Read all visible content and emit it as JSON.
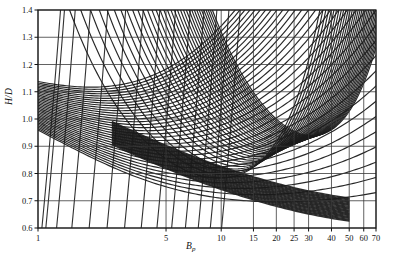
{
  "figure": {
    "background": "#ffffff",
    "line_color": "#1b1b1b",
    "grid_color": "#3a3a3a",
    "label_color": "#111111"
  },
  "axes": {
    "x_title_main": "B",
    "x_title_sub": "p",
    "y_title": "H/D"
  },
  "chart_data": {
    "type": "line",
    "title": "",
    "subtitle": "",
    "xlabel": "B_p",
    "ylabel": "H/D",
    "xscale": "log",
    "yscale": "linear",
    "xlim": [
      1,
      70
    ],
    "ylim": [
      0.6,
      1.4
    ],
    "grid": true,
    "legend": "none",
    "x_ticks": [
      1,
      5,
      10,
      15,
      20,
      25,
      30,
      40,
      50,
      60,
      70
    ],
    "x_tick_labels": [
      "1",
      "5",
      "10",
      "15",
      "20",
      "25",
      "30",
      "40",
      "50",
      "60",
      "70"
    ],
    "y_ticks": [
      0.6,
      0.7,
      0.8,
      0.9,
      1.0,
      1.1,
      1.2,
      1.3,
      1.4
    ],
    "y_tick_labels": [
      "0.6",
      "0.7",
      "0.8",
      "0.9",
      "1.0",
      "1.1",
      "1.2",
      "1.3",
      "1.4"
    ],
    "series": [
      {
        "name": "family-A",
        "role": "descending-contours",
        "count": 34
      },
      {
        "name": "family-B",
        "role": "ascending-contours",
        "count": 34
      }
    ],
    "annotations": []
  }
}
